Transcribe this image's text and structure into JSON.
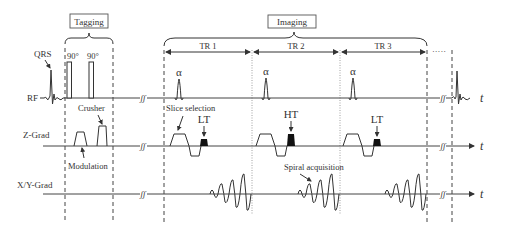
{
  "diagram": {
    "sections": {
      "tagging": "Tagging",
      "imaging": "Imaging"
    },
    "tr_labels": [
      "TR 1",
      "TR 2",
      "TR 3"
    ],
    "ellipsis": "·····",
    "channels": {
      "rf": "RF",
      "z_grad": "Z-Grad",
      "xy_grad": "X/Y-Grad"
    },
    "axis_label": "t",
    "annotations": {
      "qrs": "QRS",
      "pulse_90_a": "90°",
      "pulse_90_b": "90°",
      "crusher": "Crusher",
      "modulation": "Modulation",
      "slice_selection": "Slice selection",
      "spiral_acquisition": "Spiral acquisition",
      "alpha": "α",
      "lt1": "LT",
      "ht": "HT",
      "lt3": "LT"
    },
    "colors": {
      "line": "#333333",
      "background": "#ffffff"
    }
  }
}
